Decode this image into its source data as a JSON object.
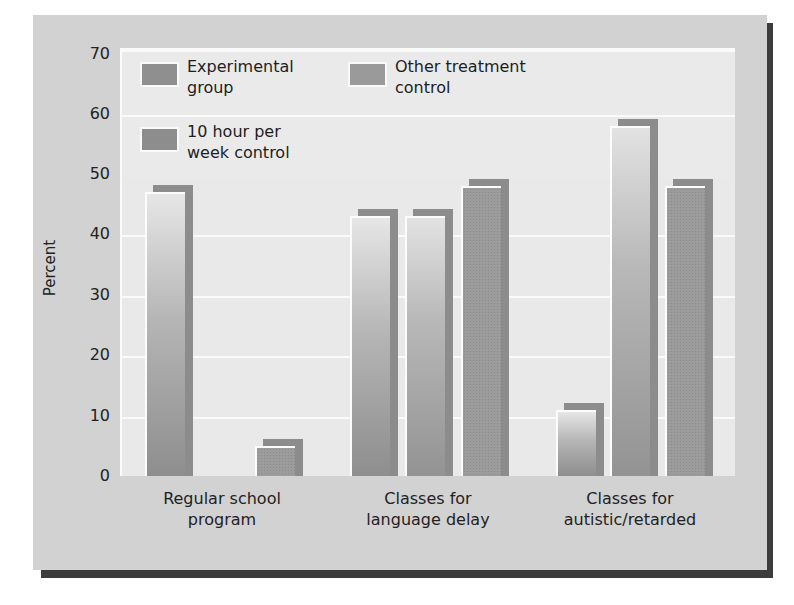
{
  "chart_data": {
    "type": "bar",
    "title": "",
    "xlabel": "",
    "ylabel": "Percent",
    "ylim": [
      0,
      70
    ],
    "yticks": [
      0,
      10,
      20,
      30,
      40,
      50,
      60,
      70
    ],
    "grid": true,
    "legend_position": "top-left inside plot",
    "categories": [
      "Regular school program",
      "Classes for language delay",
      "Classes for autistic/retarded"
    ],
    "category_labels": [
      "Regular school\nprogram",
      "Classes for\nlanguage delay",
      "Classes for\nautistic/retarded"
    ],
    "series": [
      {
        "name": "Experimental group",
        "legend_label": "Experimental\ngroup",
        "values": [
          47,
          43,
          11
        ]
      },
      {
        "name": "Other treatment control",
        "legend_label": "Other treatment\ncontrol",
        "values": [
          0,
          43,
          58
        ]
      },
      {
        "name": "10 hour per week control",
        "legend_label": "10 hour per\nweek control",
        "values": [
          5,
          48,
          48
        ]
      }
    ]
  },
  "colors": {
    "panel": "#d2d2d2",
    "plot_background": "#e9e9e9",
    "gridline": "#fafafa",
    "bar_shadow": "#8c8c8c",
    "panel_shadow": "#3c3c3c"
  }
}
